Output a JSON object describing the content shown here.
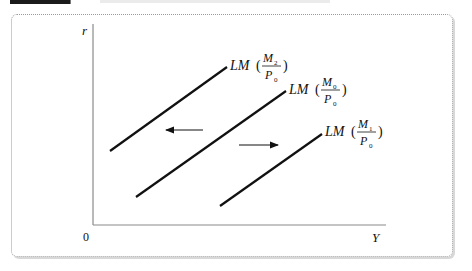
{
  "figure": {
    "type": "economics-diagram",
    "axes": {
      "y_label": "r",
      "x_label": "Y",
      "origin_label": "0"
    },
    "curves": [
      {
        "name": "LM",
        "numerator": "M",
        "numerator_sub": "2",
        "denominator": "P",
        "denominator_sub": "0"
      },
      {
        "name": "LM",
        "numerator": "M",
        "numerator_sub": "0",
        "denominator": "P",
        "denominator_sub": "0"
      },
      {
        "name": "LM",
        "numerator": "M",
        "numerator_sub": "1",
        "denominator": "P",
        "denominator_sub": "0"
      }
    ],
    "arrows": [
      {
        "direction": "left",
        "meaning": "LM shift left"
      },
      {
        "direction": "right",
        "meaning": "LM shift right"
      }
    ],
    "colors": {
      "line": "#111111",
      "axis": "#8a8a8a",
      "frame": "#9a9a9a"
    }
  }
}
